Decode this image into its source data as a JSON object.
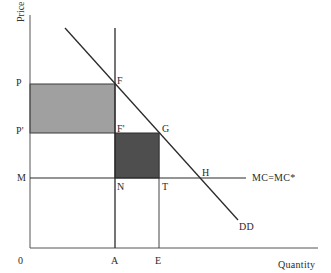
{
  "diagram": {
    "type": "economics-supply-demand",
    "axes": {
      "y_title": "Price",
      "x_title": "Quantity",
      "origin_label": "0"
    },
    "y_labels": {
      "p": "P",
      "p_prime": "P'",
      "m": "M"
    },
    "x_labels": {
      "a": "A",
      "e": "E"
    },
    "point_labels": {
      "f": "F",
      "f_prime": "F'",
      "g": "G",
      "h": "H",
      "n": "N",
      "t": "T"
    },
    "curve_labels": {
      "mc": "MC=MC*",
      "demand": "DD"
    },
    "colors": {
      "line": "#2a2a2a",
      "axis": "#555555",
      "light_rect": "#a0a0a0",
      "dark_rect": "#4e4e4e"
    },
    "shaded_regions": [
      {
        "name": "rectangle P-F-F'-P'",
        "shade": "light"
      },
      {
        "name": "rectangle F'-G-T-N",
        "shade": "dark"
      }
    ]
  }
}
